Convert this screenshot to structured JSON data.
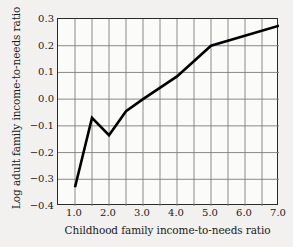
{
  "chart_data": {
    "type": "line",
    "title": "",
    "xlabel": "Childhood family income-to-needs ratio",
    "ylabel": "Log adult family income-to-needs ratio",
    "xlim": [
      0.5,
      7.0
    ],
    "ylim": [
      -0.4,
      0.3
    ],
    "grid": true,
    "legend": null,
    "x_tick_labels": [
      "1.0",
      "2.0",
      "3.0",
      "4.0",
      "5.0",
      "6.0",
      "7.0"
    ],
    "x_tick_values": [
      1.0,
      2.0,
      3.0,
      4.0,
      5.0,
      6.0,
      7.0
    ],
    "x_gridline_values": [
      1.0,
      1.5,
      2.0,
      2.5,
      3.0,
      3.5,
      4.0,
      4.5,
      5.0,
      5.5,
      6.0,
      6.5
    ],
    "y_tick_labels": [
      "0.3",
      "0.2",
      "0.1",
      "0.0",
      "−0.1",
      "−0.2",
      "−0.3",
      "−0.4"
    ],
    "y_tick_values": [
      0.3,
      0.2,
      0.1,
      0.0,
      -0.1,
      -0.2,
      -0.3,
      -0.4
    ],
    "series": [
      {
        "name": "Log adult family income-to-needs ratio",
        "color": "#000000",
        "x": [
          1.0,
          1.5,
          2.0,
          2.5,
          3.0,
          4.0,
          5.0,
          7.0
        ],
        "values": [
          -0.33,
          -0.07,
          -0.135,
          -0.045,
          0.0,
          0.085,
          0.2,
          0.275
        ]
      }
    ]
  }
}
